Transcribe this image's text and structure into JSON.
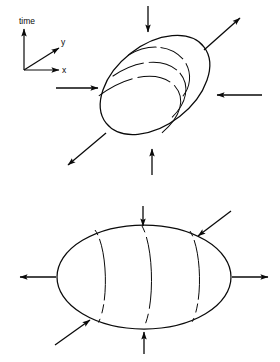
{
  "figure": {
    "title": "",
    "background_color": "#ffffff",
    "ink_color": "#0a0a0a",
    "axes_triad": {
      "name": "coordinate-axes",
      "origin": [
        24,
        70
      ],
      "labels": {
        "time": "time",
        "y": "y",
        "x": "x"
      },
      "time_axis": {
        "label": "time",
        "direction": "up",
        "tip": [
          24,
          26
        ]
      },
      "y_axis": {
        "label": "y",
        "direction": "up-right-diagonal",
        "tip": [
          56,
          46
        ]
      },
      "x_axis": {
        "label": "x",
        "direction": "right",
        "tip": [
          63,
          70
        ]
      }
    },
    "panels": [
      {
        "id": "upper-panel",
        "name": "tilted-ellipsoid-panel",
        "shape": "tilted-ellipse",
        "center": [
          155,
          85
        ],
        "radius_x": 62,
        "radius_y": 40,
        "rotation_deg": -38,
        "interior_curves": 3,
        "interior_curve_style": "nested-spiral-arcs-with-gaps",
        "arrows": [
          {
            "name": "arrow-top",
            "direction": "inward",
            "orientation": "down",
            "from": [
              148,
              6
            ],
            "to": [
              148,
              34
            ]
          },
          {
            "name": "arrow-bottom",
            "direction": "inward",
            "orientation": "up",
            "from": [
              152,
              175
            ],
            "to": [
              152,
              147
            ]
          },
          {
            "name": "arrow-left",
            "direction": "inward",
            "orientation": "right",
            "from": [
              56,
              88
            ],
            "to": [
              100,
              88
            ]
          },
          {
            "name": "arrow-right",
            "direction": "inward",
            "orientation": "left",
            "from": [
              262,
              95
            ],
            "to": [
              215,
              95
            ]
          },
          {
            "name": "arrow-upper-right-diagonal",
            "direction": "outward",
            "orientation": "up-right",
            "from": [
              204,
              50
            ],
            "to": [
              242,
              16
            ]
          },
          {
            "name": "arrow-lower-left-diagonal",
            "direction": "outward",
            "orientation": "down-left",
            "from": [
              106,
              133
            ],
            "to": [
              66,
              167
            ]
          }
        ]
      },
      {
        "id": "lower-panel",
        "name": "horizontal-ellipsoid-panel",
        "shape": "horizontal-ellipse",
        "center": [
          144,
          277
        ],
        "radius_x": 87,
        "radius_y": 52,
        "rotation_deg": 0,
        "interior_curves": 3,
        "interior_curve_style": "vertical-meridian-arcs-with-gaps",
        "arrows": [
          {
            "name": "arrow-top",
            "direction": "inward",
            "orientation": "down",
            "from": [
              143,
              206
            ],
            "to": [
              143,
              228
            ]
          },
          {
            "name": "arrow-bottom",
            "direction": "inward",
            "orientation": "up",
            "from": [
              144,
              352
            ],
            "to": [
              144,
              330
            ]
          },
          {
            "name": "arrow-left",
            "direction": "outward",
            "orientation": "left",
            "from": [
              56,
              277
            ],
            "to": [
              18,
              277
            ]
          },
          {
            "name": "arrow-right",
            "direction": "outward",
            "orientation": "right",
            "from": [
              232,
              277
            ],
            "to": [
              270,
              277
            ]
          },
          {
            "name": "arrow-upper-right-diagonal",
            "direction": "inward",
            "orientation": "down-left",
            "from": [
              229,
              212
            ],
            "to": [
              196,
              238
            ]
          },
          {
            "name": "arrow-lower-left-diagonal",
            "direction": "inward",
            "orientation": "up-right",
            "from": [
              57,
              343
            ],
            "to": [
              92,
              318
            ]
          }
        ]
      }
    ]
  }
}
